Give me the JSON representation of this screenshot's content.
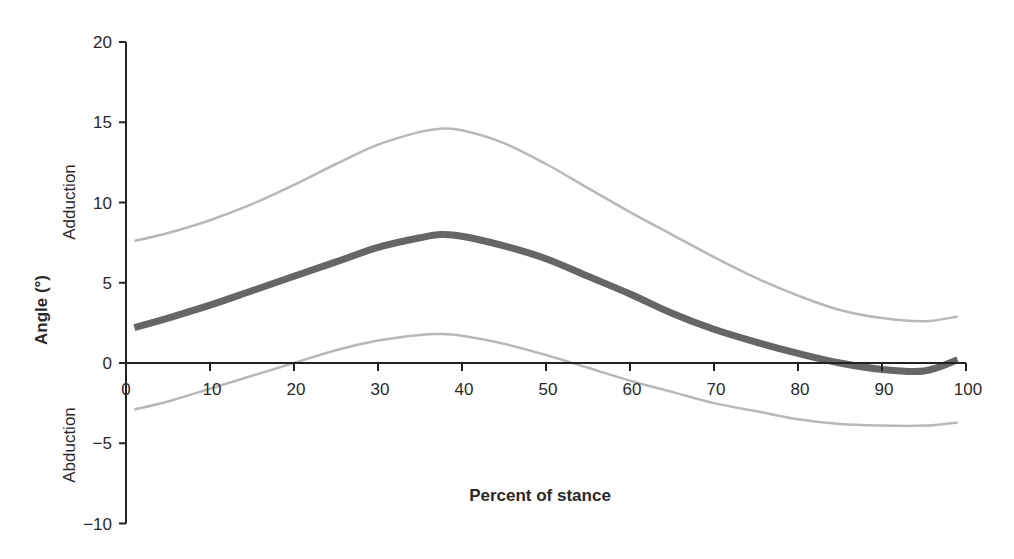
{
  "chart_data": {
    "type": "line",
    "title": "",
    "xlabel": "Percent of stance",
    "ylabel": "Angle (°)",
    "ylabel_upper": "Adduction",
    "ylabel_lower": "Abduction",
    "xlim": [
      0,
      100
    ],
    "ylim": [
      -10,
      20
    ],
    "x_ticks": [
      0,
      10,
      20,
      30,
      40,
      50,
      60,
      70,
      80,
      90,
      100
    ],
    "y_ticks": [
      20,
      15,
      10,
      5,
      0,
      -5,
      -10
    ],
    "grid": false,
    "legend": null,
    "x": [
      1,
      5,
      10,
      15,
      20,
      25,
      30,
      35,
      37.5,
      40,
      45,
      50,
      55,
      60,
      65,
      70,
      75,
      80,
      85,
      90,
      95,
      99
    ],
    "series": [
      {
        "name": "mean",
        "color": "#666666",
        "width": 7,
        "values": [
          2.2,
          2.8,
          3.6,
          4.5,
          5.4,
          6.3,
          7.2,
          7.8,
          8.0,
          7.9,
          7.3,
          6.5,
          5.4,
          4.3,
          3.1,
          2.1,
          1.3,
          0.6,
          0.0,
          -0.4,
          -0.5,
          0.2
        ]
      },
      {
        "name": "upper bound",
        "color": "#b8b8b8",
        "width": 2.5,
        "values": [
          7.6,
          8.1,
          8.9,
          9.9,
          11.1,
          12.4,
          13.6,
          14.4,
          14.6,
          14.5,
          13.7,
          12.4,
          10.9,
          9.4,
          8.0,
          6.6,
          5.3,
          4.2,
          3.3,
          2.8,
          2.6,
          2.9
        ]
      },
      {
        "name": "lower bound",
        "color": "#b8b8b8",
        "width": 2.5,
        "values": [
          -2.9,
          -2.4,
          -1.6,
          -0.8,
          0.0,
          0.8,
          1.4,
          1.75,
          1.8,
          1.7,
          1.2,
          0.5,
          -0.3,
          -1.1,
          -1.8,
          -2.5,
          -3.0,
          -3.5,
          -3.8,
          -3.9,
          -3.9,
          -3.7
        ]
      }
    ]
  }
}
